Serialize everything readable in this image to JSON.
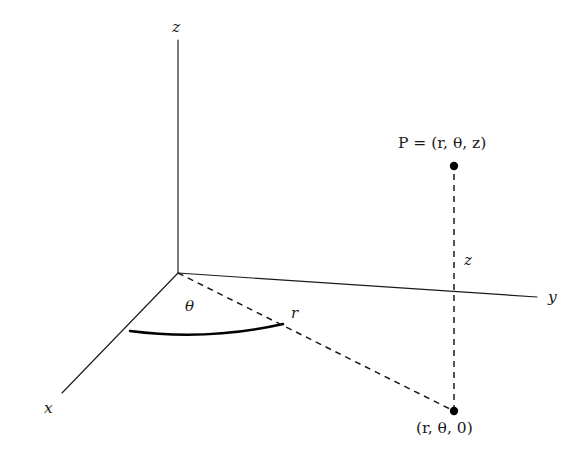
{
  "figure": {
    "background_color": "#ffffff",
    "stroke_color": "#1a1a1a",
    "width": 583,
    "height": 456
  },
  "axes": {
    "z_label": "z",
    "y_label": "y",
    "x_label": "x"
  },
  "annotations": {
    "theta_label": "θ",
    "radius_label": "r",
    "height_label": "z",
    "point_label": "P = (r, θ, z)",
    "point_label_prefix": "P",
    "point_label_equals": " = (",
    "projection_label": "(r, θ, 0)"
  },
  "geometry": {
    "origin": [
      178,
      273
    ],
    "z_axis_top": [
      178,
      40
    ],
    "y_axis_end": [
      537,
      297
    ],
    "x_axis_end": [
      62,
      393
    ],
    "arc_start": [
      130,
      331
    ],
    "arc_end": [
      283,
      324
    ],
    "projection_point": [
      454,
      411
    ],
    "space_point": [
      454,
      166
    ]
  }
}
